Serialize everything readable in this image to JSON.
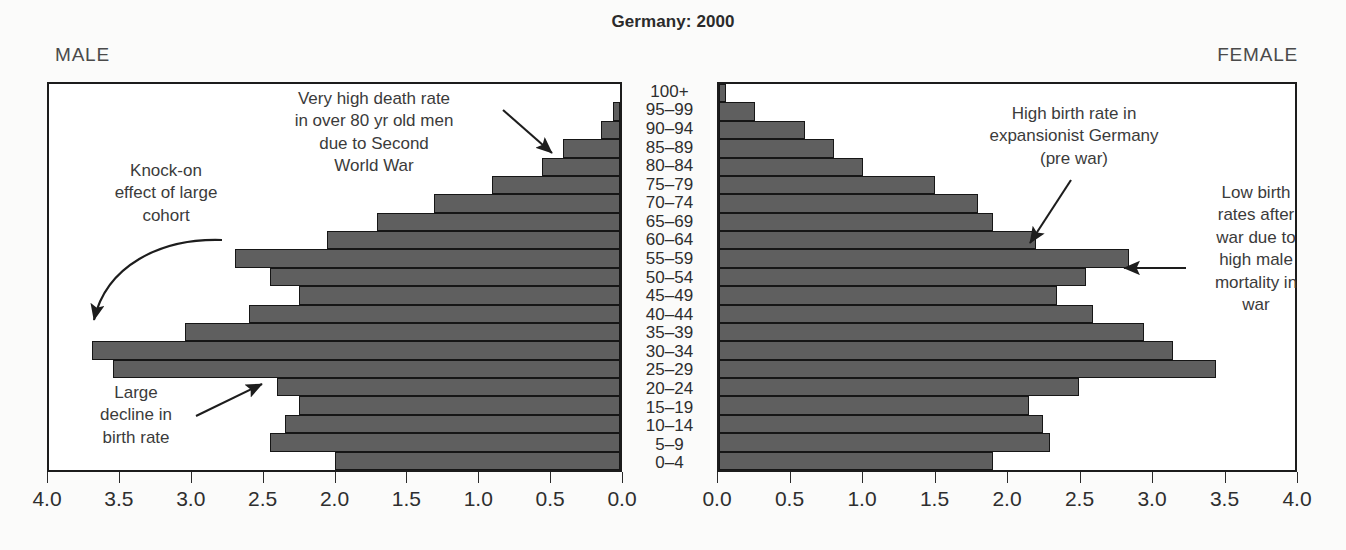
{
  "title": "Germany: 2000",
  "male_caption": "MALE",
  "female_caption": "FEMALE",
  "colors": {
    "bar_fill": "#5f5f5f",
    "bar_stroke": "#161616",
    "frame": "#1c1c1c",
    "text": "#3b3b3b",
    "background": "#fbfbfa"
  },
  "annotations": {
    "death_rate": "Very high death rate\nin over 80 yr old men\ndue to Second\nWorld War",
    "knock_on": "Knock-on\neffect of large\ncohort",
    "birth_decline": "Large\ndecline in\nbirth rate",
    "high_birth": "High birth rate in\nexpansionist Germany\n(pre war)",
    "low_birth": "Low birth\nrates after\nwar due to\nhigh male\nmortality in\nwar"
  },
  "chart_data": {
    "type": "bar",
    "subtype": "population-pyramid",
    "title": "Germany: 2000",
    "xlabel": "",
    "ylabel": "",
    "grid": false,
    "legend": "none",
    "axis_left": {
      "label": "MALE",
      "ticks": [
        "4.0",
        "3.5",
        "3.0",
        "2.5",
        "2.0",
        "1.5",
        "1.0",
        "0.5",
        "0.0"
      ],
      "tick_values": [
        4.0,
        3.5,
        3.0,
        2.5,
        2.0,
        1.5,
        1.0,
        0.5,
        0.0
      ],
      "range": [
        4.0,
        0.0
      ],
      "direction": "reversed"
    },
    "axis_right": {
      "label": "FEMALE",
      "ticks": [
        "0.0",
        "0.5",
        "1.0",
        "1.5",
        "2.0",
        "2.5",
        "3.0",
        "3.5",
        "4.0"
      ],
      "tick_values": [
        0.0,
        0.5,
        1.0,
        1.5,
        2.0,
        2.5,
        3.0,
        3.5,
        4.0
      ],
      "range": [
        0.0,
        4.0
      ],
      "direction": "normal"
    },
    "xlim": [
      0,
      4.0
    ],
    "categories": [
      "100+",
      "95–99",
      "90–94",
      "85–89",
      "80–84",
      "75–79",
      "70–74",
      "65–69",
      "60–64",
      "55–59",
      "50–54",
      "45–49",
      "40–44",
      "35–39",
      "30–34",
      "25–29",
      "20–24",
      "15–19",
      "10–14",
      "5–9",
      "0–4"
    ],
    "series": [
      {
        "name": "MALE",
        "side": "left",
        "values": [
          0.0,
          0.05,
          0.13,
          0.4,
          0.55,
          0.9,
          1.3,
          1.7,
          2.05,
          2.7,
          2.45,
          2.25,
          2.6,
          3.05,
          3.7,
          3.55,
          2.4,
          2.25,
          2.35,
          2.45,
          2.0
        ]
      },
      {
        "name": "FEMALE",
        "side": "right",
        "values": [
          0.05,
          0.25,
          0.6,
          0.8,
          1.0,
          1.5,
          1.8,
          1.9,
          2.2,
          2.85,
          2.55,
          2.35,
          2.6,
          2.95,
          3.15,
          3.45,
          2.5,
          2.15,
          2.25,
          2.3,
          1.9
        ]
      }
    ],
    "annotations": [
      {
        "text": "Very high death rate in over 80 yr old men due to Second World War",
        "target_category": "85–89",
        "side": "left"
      },
      {
        "text": "Knock-on effect of large cohort",
        "target_category": "60–64",
        "side": "left"
      },
      {
        "text": "Large decline in birth rate",
        "target_category": "25–29",
        "side": "left"
      },
      {
        "text": "High birth rate in expansionist Germany (pre war)",
        "target_category": "55–59",
        "side": "right"
      },
      {
        "text": "Low birth rates after war due to high male mortality in war",
        "target_category": "50–54",
        "side": "right"
      }
    ]
  }
}
